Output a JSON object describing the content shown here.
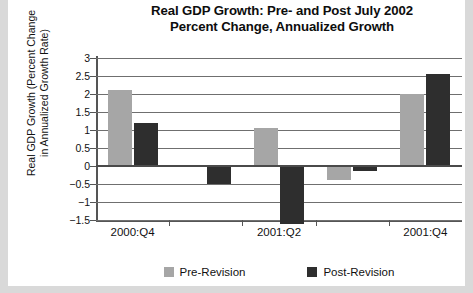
{
  "chart_data": {
    "type": "bar",
    "title": "Real GDP Growth: Pre- and Post July 2002\nPercent Change, Annualized Growth",
    "title_line1": "Real GDP Growth: Pre- and Post July 2002",
    "title_line2": "Percent Change, Annualized Growth",
    "ylabel": "Real GDP Growth (Percent Change in Annualized Growth Rate)",
    "ylabel_line1": "Real GDP Growth (Percent Change",
    "ylabel_line2": "in Annualized Growth Rate)",
    "xlabel": "",
    "categories": [
      "2000:Q4",
      "2001:Q1",
      "2001:Q2",
      "2001:Q3",
      "2001:Q4"
    ],
    "xtick_labels": [
      "2000:Q4",
      "2001:Q2",
      "2001:Q4"
    ],
    "xtick_label_positions": [
      0,
      2,
      4
    ],
    "ylim": [
      -1.5,
      3
    ],
    "yticks": [
      3,
      2.5,
      2,
      1.5,
      1,
      0.5,
      0,
      -0.5,
      -1,
      -1.5
    ],
    "ytick_labels": [
      "3",
      "2.5",
      "2",
      "1.5",
      "1",
      "0.5",
      "0",
      "−0.5",
      "−1",
      "−1.5"
    ],
    "grid": true,
    "legend_position": "bottom",
    "series": [
      {
        "name": "Pre-Revision",
        "color": "#a6a6a6",
        "values": [
          2.1,
          0,
          1.05,
          -0.4,
          2.0
        ]
      },
      {
        "name": "Post-Revision",
        "color": "#2e2e2e",
        "values": [
          1.2,
          -0.5,
          -1.6,
          -0.15,
          2.55
        ]
      }
    ]
  },
  "legend": {
    "items": [
      {
        "label": "Pre-Revision",
        "color": "#a6a6a6"
      },
      {
        "label": "Post-Revision",
        "color": "#2e2e2e"
      }
    ]
  }
}
